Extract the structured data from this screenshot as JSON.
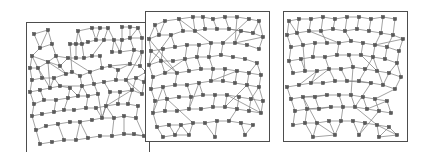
{
  "figure": {
    "title": "",
    "width": 421,
    "height": 152,
    "background": "#ffffff",
    "panel_count": 3,
    "panel_border_color": "#4d4d4d",
    "node_color": "#5a5a5a",
    "edge_color": "#7a7a7a",
    "node_shape": "square",
    "node_size_px": 3.2,
    "layout": "three-panels-horizontal"
  },
  "chart_data": {
    "type": "scatter",
    "title": "",
    "xlabel": "",
    "ylabel": "",
    "subtype": "node-link-graph-triptych",
    "panels": [
      {
        "name": "panel-1",
        "label": "",
        "x": 13,
        "y": 11,
        "width": 124,
        "height": 131,
        "xlim": [
          0,
          124
        ],
        "ylim": [
          0,
          131
        ],
        "node_count": 96,
        "nodes": [
          [
            8,
            12
          ],
          [
            22,
            8
          ],
          [
            52,
            9
          ],
          [
            66,
            6
          ],
          [
            74,
            6
          ],
          [
            82,
            6
          ],
          [
            96,
            5
          ],
          [
            104,
            5
          ],
          [
            112,
            6
          ],
          [
            6,
            34
          ],
          [
            14,
            26
          ],
          [
            26,
            22
          ],
          [
            30,
            34
          ],
          [
            44,
            22
          ],
          [
            50,
            22
          ],
          [
            56,
            22
          ],
          [
            62,
            20
          ],
          [
            70,
            18
          ],
          [
            78,
            18
          ],
          [
            88,
            18
          ],
          [
            96,
            18
          ],
          [
            104,
            16
          ],
          [
            116,
            16
          ],
          [
            4,
            46
          ],
          [
            12,
            46
          ],
          [
            22,
            40
          ],
          [
            34,
            44
          ],
          [
            42,
            36
          ],
          [
            50,
            36
          ],
          [
            58,
            36
          ],
          [
            66,
            34
          ],
          [
            74,
            34
          ],
          [
            86,
            30
          ],
          [
            94,
            30
          ],
          [
            108,
            28
          ],
          [
            116,
            30
          ],
          [
            6,
            58
          ],
          [
            16,
            56
          ],
          [
            28,
            56
          ],
          [
            40,
            52
          ],
          [
            46,
            50
          ],
          [
            54,
            54
          ],
          [
            64,
            50
          ],
          [
            76,
            46
          ],
          [
            84,
            44
          ],
          [
            92,
            48
          ],
          [
            104,
            42
          ],
          [
            114,
            44
          ],
          [
            120,
            50
          ],
          [
            4,
            70
          ],
          [
            14,
            68
          ],
          [
            24,
            66
          ],
          [
            34,
            64
          ],
          [
            44,
            66
          ],
          [
            56,
            64
          ],
          [
            68,
            62
          ],
          [
            78,
            60
          ],
          [
            90,
            58
          ],
          [
            100,
            58
          ],
          [
            110,
            56
          ],
          [
            118,
            60
          ],
          [
            8,
            82
          ],
          [
            18,
            78
          ],
          [
            30,
            78
          ],
          [
            42,
            76
          ],
          [
            52,
            74
          ],
          [
            62,
            74
          ],
          [
            72,
            72
          ],
          [
            84,
            70
          ],
          [
            94,
            70
          ],
          [
            106,
            68
          ],
          [
            116,
            72
          ],
          [
            6,
            94
          ],
          [
            16,
            92
          ],
          [
            28,
            90
          ],
          [
            38,
            88
          ],
          [
            48,
            88
          ],
          [
            60,
            86
          ],
          [
            70,
            86
          ],
          [
            80,
            84
          ],
          [
            92,
            82
          ],
          [
            102,
            82
          ],
          [
            112,
            84
          ],
          [
            10,
            108
          ],
          [
            20,
            104
          ],
          [
            32,
            102
          ],
          [
            44,
            100
          ],
          [
            54,
            100
          ],
          [
            66,
            98
          ],
          [
            76,
            96
          ],
          [
            88,
            96
          ],
          [
            98,
            94
          ],
          [
            110,
            96
          ],
          [
            14,
            122
          ],
          [
            26,
            120
          ],
          [
            38,
            118
          ],
          [
            50,
            118
          ],
          [
            62,
            116
          ],
          [
            74,
            114
          ],
          [
            86,
            114
          ],
          [
            98,
            112
          ],
          [
            108,
            112
          ],
          [
            118,
            114
          ]
        ]
      },
      {
        "name": "panel-2",
        "label": "",
        "x": 145,
        "y": 11,
        "width": 125,
        "height": 131,
        "xlim": [
          0,
          125
        ],
        "ylim": [
          0,
          131
        ],
        "node_count": 94,
        "nodes": [
          [
            10,
            14
          ],
          [
            20,
            10
          ],
          [
            34,
            8
          ],
          [
            48,
            6
          ],
          [
            58,
            6
          ],
          [
            68,
            8
          ],
          [
            80,
            6
          ],
          [
            92,
            6
          ],
          [
            104,
            8
          ],
          [
            114,
            10
          ],
          [
            4,
            28
          ],
          [
            14,
            24
          ],
          [
            26,
            24
          ],
          [
            38,
            20
          ],
          [
            50,
            20
          ],
          [
            60,
            18
          ],
          [
            72,
            18
          ],
          [
            84,
            18
          ],
          [
            96,
            20
          ],
          [
            108,
            22
          ],
          [
            118,
            26
          ],
          [
            6,
            40
          ],
          [
            18,
            38
          ],
          [
            30,
            36
          ],
          [
            42,
            34
          ],
          [
            54,
            34
          ],
          [
            66,
            32
          ],
          [
            78,
            32
          ],
          [
            90,
            32
          ],
          [
            102,
            34
          ],
          [
            114,
            38
          ],
          [
            4,
            54
          ],
          [
            16,
            50
          ],
          [
            28,
            50
          ],
          [
            40,
            48
          ],
          [
            52,
            46
          ],
          [
            64,
            46
          ],
          [
            76,
            44
          ],
          [
            88,
            46
          ],
          [
            100,
            48
          ],
          [
            112,
            52
          ],
          [
            8,
            66
          ],
          [
            20,
            62
          ],
          [
            32,
            62
          ],
          [
            44,
            60
          ],
          [
            56,
            58
          ],
          [
            68,
            58
          ],
          [
            80,
            58
          ],
          [
            92,
            60
          ],
          [
            104,
            62
          ],
          [
            116,
            64
          ],
          [
            6,
            78
          ],
          [
            18,
            76
          ],
          [
            30,
            74
          ],
          [
            42,
            74
          ],
          [
            54,
            72
          ],
          [
            66,
            70
          ],
          [
            78,
            70
          ],
          [
            90,
            72
          ],
          [
            102,
            74
          ],
          [
            114,
            76
          ],
          [
            10,
            90
          ],
          [
            22,
            88
          ],
          [
            34,
            86
          ],
          [
            46,
            86
          ],
          [
            58,
            84
          ],
          [
            70,
            84
          ],
          [
            82,
            84
          ],
          [
            94,
            86
          ],
          [
            106,
            88
          ],
          [
            118,
            90
          ],
          [
            8,
            102
          ],
          [
            20,
            100
          ],
          [
            32,
            100
          ],
          [
            44,
            98
          ],
          [
            56,
            98
          ],
          [
            68,
            96
          ],
          [
            80,
            96
          ],
          [
            92,
            98
          ],
          [
            104,
            100
          ],
          [
            116,
            102
          ],
          [
            12,
            116
          ],
          [
            24,
            114
          ],
          [
            36,
            114
          ],
          [
            48,
            112
          ],
          [
            60,
            112
          ],
          [
            72,
            110
          ],
          [
            84,
            110
          ],
          [
            96,
            112
          ],
          [
            108,
            114
          ],
          [
            18,
            126
          ],
          [
            30,
            124
          ],
          [
            44,
            124
          ],
          [
            70,
            126
          ],
          [
            100,
            124
          ]
        ]
      },
      {
        "name": "panel-3",
        "label": "",
        "x": 283,
        "y": 11,
        "width": 125,
        "height": 131,
        "xlim": [
          0,
          125
        ],
        "ylim": [
          0,
          131
        ],
        "node_count": 92,
        "nodes": [
          [
            6,
            10
          ],
          [
            16,
            8
          ],
          [
            28,
            8
          ],
          [
            40,
            6
          ],
          [
            52,
            8
          ],
          [
            64,
            6
          ],
          [
            76,
            6
          ],
          [
            88,
            8
          ],
          [
            100,
            6
          ],
          [
            112,
            8
          ],
          [
            4,
            24
          ],
          [
            14,
            22
          ],
          [
            26,
            20
          ],
          [
            38,
            20
          ],
          [
            50,
            18
          ],
          [
            62,
            20
          ],
          [
            74,
            18
          ],
          [
            86,
            20
          ],
          [
            98,
            22
          ],
          [
            110,
            24
          ],
          [
            120,
            28
          ],
          [
            8,
            36
          ],
          [
            20,
            34
          ],
          [
            32,
            32
          ],
          [
            44,
            32
          ],
          [
            56,
            32
          ],
          [
            68,
            30
          ],
          [
            80,
            32
          ],
          [
            92,
            34
          ],
          [
            104,
            36
          ],
          [
            116,
            40
          ],
          [
            6,
            50
          ],
          [
            18,
            48
          ],
          [
            30,
            46
          ],
          [
            42,
            46
          ],
          [
            54,
            44
          ],
          [
            66,
            44
          ],
          [
            78,
            44
          ],
          [
            90,
            46
          ],
          [
            102,
            48
          ],
          [
            114,
            52
          ],
          [
            10,
            62
          ],
          [
            22,
            60
          ],
          [
            34,
            60
          ],
          [
            46,
            58
          ],
          [
            58,
            58
          ],
          [
            70,
            56
          ],
          [
            82,
            58
          ],
          [
            94,
            60
          ],
          [
            106,
            62
          ],
          [
            118,
            66
          ],
          [
            4,
            76
          ],
          [
            16,
            74
          ],
          [
            28,
            72
          ],
          [
            40,
            72
          ],
          [
            52,
            70
          ],
          [
            64,
            70
          ],
          [
            76,
            70
          ],
          [
            88,
            72
          ],
          [
            100,
            74
          ],
          [
            112,
            78
          ],
          [
            8,
            88
          ],
          [
            20,
            86
          ],
          [
            32,
            86
          ],
          [
            44,
            84
          ],
          [
            56,
            84
          ],
          [
            68,
            84
          ],
          [
            80,
            86
          ],
          [
            92,
            88
          ],
          [
            104,
            90
          ],
          [
            12,
            100
          ],
          [
            24,
            98
          ],
          [
            36,
            98
          ],
          [
            48,
            96
          ],
          [
            60,
            96
          ],
          [
            72,
            96
          ],
          [
            84,
            98
          ],
          [
            96,
            100
          ],
          [
            108,
            102
          ],
          [
            10,
            114
          ],
          [
            22,
            112
          ],
          [
            34,
            112
          ],
          [
            46,
            110
          ],
          [
            58,
            110
          ],
          [
            70,
            110
          ],
          [
            82,
            112
          ],
          [
            94,
            114
          ],
          [
            106,
            116
          ],
          [
            30,
            126
          ],
          [
            52,
            124
          ],
          [
            76,
            124
          ],
          [
            96,
            126
          ],
          [
            114,
            124
          ]
        ]
      }
    ]
  }
}
